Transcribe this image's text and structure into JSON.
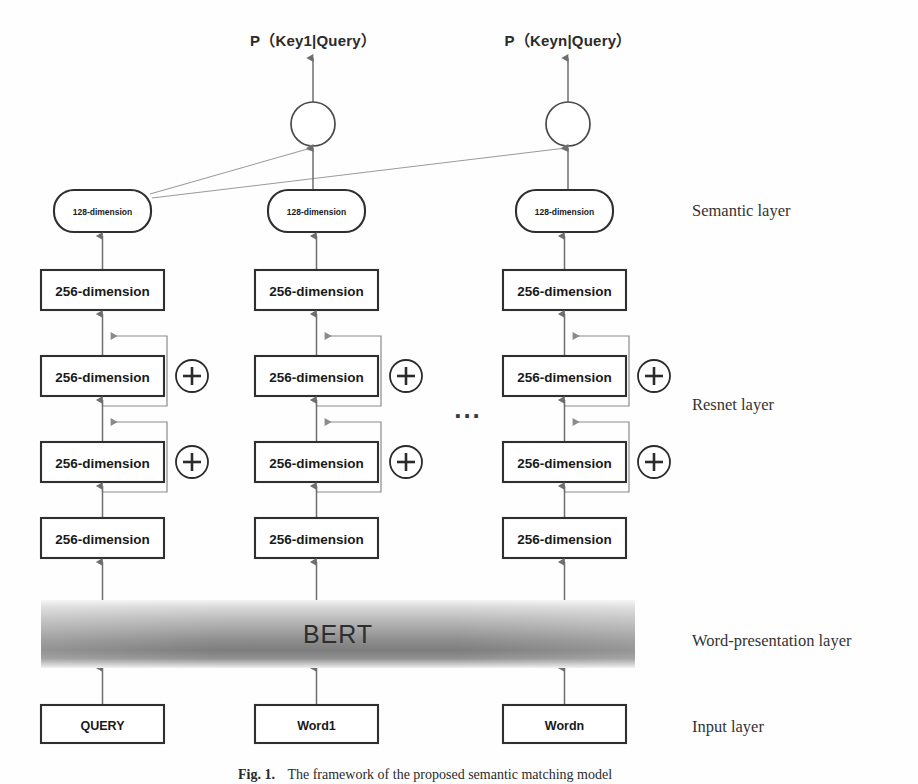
{
  "figure": {
    "title_outputs": [
      {
        "id": "p-key1",
        "text": "P（Key1|Query）",
        "x": 313,
        "y": 46
      },
      {
        "id": "p-keyn",
        "text": "P（Keyn|Query）",
        "x": 568,
        "y": 46
      }
    ],
    "bert_label": "BERT",
    "ellipsis": "...",
    "side_labels": [
      {
        "id": "semantic",
        "text": "Semantic layer",
        "x": 692,
        "y": 216
      },
      {
        "id": "resnet",
        "text": "Resnet layer",
        "x": 692,
        "y": 410
      },
      {
        "id": "word-presentation",
        "text": "Word-presentation layer",
        "x": 692,
        "y": 646
      },
      {
        "id": "input",
        "text": "Input layer",
        "x": 692,
        "y": 732
      }
    ],
    "columns": [
      {
        "id": "query-column",
        "center_x": 102,
        "semantic_box": "128-dimension",
        "resnet_boxes": [
          "256-dimension",
          "256-dimension",
          "256-dimension",
          "256-dimension"
        ],
        "input_box": "QUERY"
      },
      {
        "id": "word1-column",
        "center_x": 316,
        "semantic_box": "128-dimension",
        "resnet_boxes": [
          "256-dimension",
          "256-dimension",
          "256-dimension",
          "256-dimension"
        ],
        "input_box": "Word1"
      },
      {
        "id": "wordn-column",
        "center_x": 564,
        "semantic_box": "128-dimension",
        "resnet_boxes": [
          "256-dimension",
          "256-dimension",
          "256-dimension",
          "256-dimension"
        ],
        "input_box": "Wordn"
      }
    ],
    "output_nodes": [
      {
        "id": "softmax-node-1",
        "cx": 313,
        "cy": 124,
        "r": 22
      },
      {
        "id": "softmax-node-n",
        "cx": 568,
        "cy": 124,
        "r": 22
      }
    ],
    "caption": {
      "bold": "Fig. 1.",
      "text": "The framework of the proposed semantic matching model"
    },
    "colors": {
      "stroke": "#2f2f2f",
      "flow": "#6e6e6e",
      "skip": "#8a8a8a",
      "text": "#1a1a1a",
      "bert_dark": "#6f6f6f",
      "bert_light": "#e9e9e9"
    }
  }
}
